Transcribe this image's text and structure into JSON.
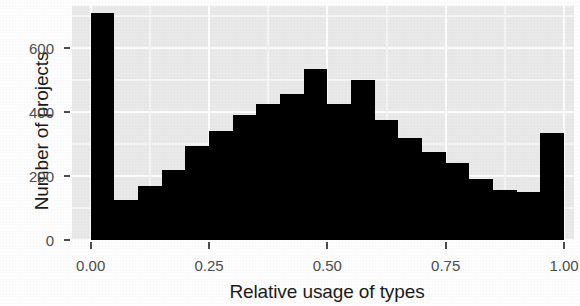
{
  "chart_data": {
    "type": "bar",
    "title": "",
    "subtitle": "",
    "xlabel": "Relative usage of types",
    "ylabel": "Number of projects",
    "xlim": [
      -0.025,
      1.025
    ],
    "ylim": [
      0,
      740
    ],
    "grid": true,
    "legend": null,
    "bin_width": 0.05,
    "x_ticks": [
      0.0,
      0.25,
      0.5,
      0.75,
      1.0
    ],
    "x_tick_labels": [
      "0.00",
      "0.25",
      "0.50",
      "0.75",
      "1.00"
    ],
    "y_ticks": [
      0,
      200,
      400,
      600
    ],
    "y_tick_labels": [
      "0",
      "200",
      "400",
      "600"
    ],
    "bar_color": "#000000",
    "panel_color": "#ebebeb",
    "gridline_color": "#ffffff",
    "categories": [
      "0.000-0.050",
      "0.050-0.100",
      "0.100-0.150",
      "0.150-0.200",
      "0.200-0.250",
      "0.250-0.300",
      "0.300-0.350",
      "0.350-0.400",
      "0.400-0.450",
      "0.450-0.500",
      "0.500-0.550",
      "0.550-0.600",
      "0.600-0.650",
      "0.650-0.700",
      "0.700-0.750",
      "0.750-0.800",
      "0.800-0.850",
      "0.850-0.900",
      "0.900-0.950",
      "0.950-1.000"
    ],
    "bin_starts": [
      0.0,
      0.05,
      0.1,
      0.15,
      0.2,
      0.25,
      0.3,
      0.35,
      0.4,
      0.45,
      0.5,
      0.55,
      0.6,
      0.65,
      0.7,
      0.75,
      0.8,
      0.85,
      0.9,
      0.95
    ],
    "values": [
      710,
      125,
      170,
      220,
      295,
      340,
      390,
      425,
      455,
      535,
      425,
      500,
      375,
      320,
      275,
      240,
      190,
      155,
      150,
      335
    ]
  }
}
